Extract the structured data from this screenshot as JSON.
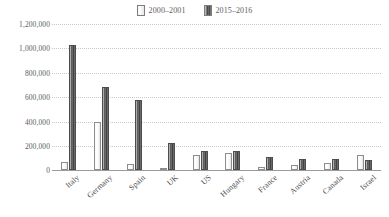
{
  "chart_data": {
    "type": "bar",
    "title": "",
    "subtitle": "",
    "xlabel": "",
    "ylabel": "",
    "ylim": [
      0,
      1200000
    ],
    "ytick_labels": [
      "1,200,000",
      "1,000,000",
      "800,000",
      "600,000",
      "400,000",
      "200,000",
      "0"
    ],
    "ytick_values": [
      1200000,
      1000000,
      800000,
      600000,
      400000,
      200000,
      0
    ],
    "ytick_interval": 200000,
    "grid": "horizontal-dotted",
    "legend_position": "top-center",
    "categories": [
      "Italy",
      "Germany",
      "Spain",
      "UK",
      "US",
      "Hungary",
      "France",
      "Austria",
      "Canada",
      "Israel"
    ],
    "series": [
      {
        "name": "2000–2001",
        "style": "light",
        "color": "#f2f2f2",
        "values": [
          68000,
          395000,
          50000,
          4000,
          125000,
          140000,
          25000,
          38000,
          58000,
          122000
        ]
      },
      {
        "name": "2015–2016",
        "style": "dark",
        "color": "#4f4f4f",
        "values": [
          1030000,
          680000,
          575000,
          225000,
          155000,
          155000,
          105000,
          92000,
          90000,
          80000
        ]
      }
    ]
  },
  "legend": {
    "entries": [
      {
        "label": "2000–2001",
        "swatch": "light-bar-swatch"
      },
      {
        "label": "2015–2016",
        "swatch": "dark-bar-swatch"
      }
    ]
  },
  "colors": {
    "background": "#ffffff",
    "gridline": "#c9c9c9",
    "axis": "#9a9a9a",
    "text": "#5d5d5d",
    "series_light": "#f2f2f2",
    "series_dark": "#4f4f4f"
  }
}
